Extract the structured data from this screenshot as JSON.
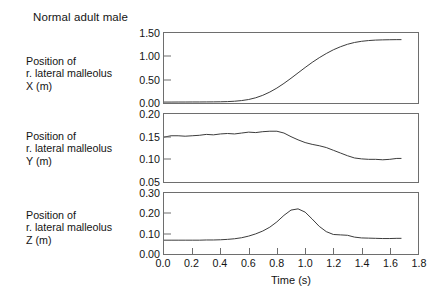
{
  "figure": {
    "title": "Normal adult male",
    "background": "#ffffff",
    "trace_color": "#3c3c3c",
    "axis_color": "#6e6e6e"
  },
  "axis": {
    "x_title": "Time (s)",
    "x_ticks": [
      "0.0",
      "0.2",
      "0.4",
      "0.6",
      "0.8",
      "1.0",
      "1.2",
      "1.4",
      "1.6",
      "1.8"
    ]
  },
  "panels": [
    {
      "key": "x",
      "label_lines": [
        "Position of",
        "r. lateral malleolus",
        "X (m)"
      ],
      "y_ticks": [
        "1.50",
        "1.00",
        "0.50",
        "0.00"
      ]
    },
    {
      "key": "y",
      "label_lines": [
        "Position of",
        "r. lateral malleolus",
        "Y (m)"
      ],
      "y_ticks": [
        "0.20",
        "0.15",
        "0.10",
        "0.05"
      ]
    },
    {
      "key": "z",
      "label_lines": [
        "Position of",
        "r. lateral malleolus",
        "Z (m)"
      ],
      "y_ticks": [
        "0.30",
        "0.20",
        "0.10",
        "0.00"
      ]
    }
  ],
  "chart_data": {
    "type": "line",
    "title": "Normal adult male",
    "xlabel": "Time (s)",
    "xlim": [
      0.0,
      1.8
    ],
    "xticks": [
      0.0,
      0.2,
      0.4,
      0.6,
      0.8,
      1.0,
      1.2,
      1.4,
      1.6,
      1.8
    ],
    "grid": false,
    "legend": "none",
    "subplots": [
      {
        "name": "Position of r. lateral malleolus X (m)",
        "ylabel": "Position of r. lateral malleolus X (m)",
        "ylim": [
          0.0,
          1.5
        ],
        "yticks": [
          0.0,
          0.5,
          1.0,
          1.5
        ],
        "x": [
          0.0,
          0.05,
          0.1,
          0.15,
          0.2,
          0.25,
          0.3,
          0.35,
          0.4,
          0.45,
          0.5,
          0.55,
          0.6,
          0.65,
          0.7,
          0.75,
          0.8,
          0.85,
          0.9,
          0.95,
          1.0,
          1.05,
          1.1,
          1.15,
          1.2,
          1.25,
          1.3,
          1.35,
          1.4,
          1.45,
          1.5,
          1.55,
          1.6,
          1.65,
          1.68
        ],
        "y": [
          0.02,
          0.02,
          0.021,
          0.021,
          0.022,
          0.022,
          0.023,
          0.024,
          0.026,
          0.03,
          0.038,
          0.052,
          0.075,
          0.112,
          0.165,
          0.235,
          0.32,
          0.42,
          0.53,
          0.645,
          0.76,
          0.87,
          0.97,
          1.06,
          1.14,
          1.205,
          1.258,
          1.297,
          1.322,
          1.338,
          1.348,
          1.353,
          1.356,
          1.358,
          1.358
        ]
      },
      {
        "name": "Position of r. lateral malleolus Y (m)",
        "ylabel": "Position of r. lateral malleolus Y (m)",
        "ylim": [
          0.05,
          0.2
        ],
        "yticks": [
          0.05,
          0.1,
          0.15,
          0.2
        ],
        "x": [
          0.0,
          0.05,
          0.1,
          0.15,
          0.2,
          0.25,
          0.3,
          0.35,
          0.4,
          0.45,
          0.5,
          0.55,
          0.6,
          0.65,
          0.7,
          0.75,
          0.8,
          0.85,
          0.9,
          0.95,
          1.0,
          1.05,
          1.1,
          1.15,
          1.2,
          1.25,
          1.3,
          1.35,
          1.4,
          1.45,
          1.5,
          1.55,
          1.6,
          1.65,
          1.68
        ],
        "y": [
          0.149,
          0.152,
          0.152,
          0.151,
          0.152,
          0.153,
          0.155,
          0.154,
          0.156,
          0.157,
          0.156,
          0.158,
          0.16,
          0.159,
          0.161,
          0.162,
          0.162,
          0.158,
          0.15,
          0.143,
          0.137,
          0.133,
          0.13,
          0.126,
          0.12,
          0.114,
          0.108,
          0.103,
          0.101,
          0.1,
          0.1,
          0.099,
          0.1,
          0.102,
          0.102
        ]
      },
      {
        "name": "Position of r. lateral malleolus Z (m)",
        "ylabel": "Position of r. lateral malleolus Z (m)",
        "ylim": [
          0.0,
          0.3
        ],
        "yticks": [
          0.0,
          0.1,
          0.2,
          0.3
        ],
        "x": [
          0.0,
          0.05,
          0.1,
          0.15,
          0.2,
          0.25,
          0.3,
          0.35,
          0.4,
          0.45,
          0.5,
          0.55,
          0.6,
          0.65,
          0.7,
          0.75,
          0.8,
          0.85,
          0.9,
          0.95,
          1.0,
          1.05,
          1.1,
          1.15,
          1.2,
          1.25,
          1.3,
          1.35,
          1.4,
          1.45,
          1.5,
          1.55,
          1.6,
          1.65,
          1.68
        ],
        "y": [
          0.068,
          0.068,
          0.068,
          0.068,
          0.068,
          0.068,
          0.069,
          0.069,
          0.07,
          0.072,
          0.075,
          0.08,
          0.088,
          0.099,
          0.113,
          0.132,
          0.158,
          0.19,
          0.216,
          0.222,
          0.206,
          0.172,
          0.136,
          0.11,
          0.096,
          0.094,
          0.092,
          0.083,
          0.079,
          0.078,
          0.077,
          0.076,
          0.076,
          0.077,
          0.077
        ]
      }
    ]
  }
}
